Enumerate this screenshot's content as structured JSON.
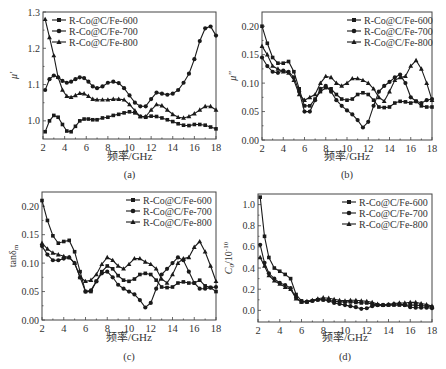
{
  "figure": {
    "legend_labels": [
      "R-Co@C/Fe-600",
      "R-Co@C/Fe-700",
      "R-Co@C/Fe-800"
    ],
    "xlabel": "频率/GHz"
  },
  "chart_data": [
    {
      "id": "a",
      "type": "line",
      "caption": "(a)",
      "title": "",
      "xlabel": "频率/GHz",
      "ylabel": "μ'",
      "xlim": [
        2,
        18
      ],
      "ylim": [
        0.95,
        1.3
      ],
      "xticks": [
        2,
        4,
        6,
        8,
        10,
        12,
        14,
        16,
        18
      ],
      "yticks": [
        1.0,
        1.1,
        1.2,
        1.3
      ],
      "ytick_labels": [
        "1.0",
        "1.1",
        "1.2",
        "1.3"
      ],
      "legend_position": "upper left",
      "grid": false,
      "series": [
        {
          "name": "R-Co@C/Fe-600",
          "marker": "square",
          "x": [
            2.2,
            2.6,
            3.0,
            3.4,
            3.8,
            4.2,
            4.6,
            5.0,
            5.4,
            5.8,
            6.2,
            6.6,
            7.0,
            7.5,
            8.0,
            8.5,
            9.0,
            9.5,
            10.0,
            10.5,
            11.0,
            11.5,
            12.0,
            12.5,
            13.0,
            13.5,
            14.0,
            14.5,
            15.0,
            15.5,
            16.0,
            16.5,
            17.0,
            17.5,
            18.0
          ],
          "y": [
            0.97,
            1.0,
            1.015,
            1.01,
            0.99,
            0.972,
            0.97,
            0.985,
            1.0,
            1.005,
            1.005,
            1.003,
            1.003,
            1.008,
            1.01,
            1.015,
            1.018,
            1.022,
            1.025,
            1.022,
            1.012,
            1.01,
            1.013,
            1.012,
            1.008,
            1.003,
            0.998,
            0.992,
            0.988,
            0.987,
            0.99,
            0.99,
            0.988,
            0.983,
            0.978
          ]
        },
        {
          "name": "R-Co@C/Fe-700",
          "marker": "circle",
          "x": [
            2.2,
            2.6,
            3.0,
            3.4,
            3.8,
            4.2,
            4.6,
            5.0,
            5.4,
            5.8,
            6.2,
            6.6,
            7.0,
            7.5,
            8.0,
            8.5,
            9.0,
            9.5,
            10.0,
            10.5,
            11.0,
            11.5,
            12.0,
            12.5,
            13.0,
            13.5,
            14.0,
            14.5,
            15.0,
            15.5,
            16.0,
            16.5,
            17.0,
            17.5,
            18.0
          ],
          "y": [
            1.085,
            1.115,
            1.125,
            1.12,
            1.11,
            1.105,
            1.108,
            1.115,
            1.12,
            1.118,
            1.108,
            1.095,
            1.09,
            1.095,
            1.105,
            1.108,
            1.104,
            1.09,
            1.07,
            1.05,
            1.04,
            1.04,
            1.06,
            1.078,
            1.075,
            1.072,
            1.075,
            1.085,
            1.105,
            1.13,
            1.17,
            1.22,
            1.255,
            1.26,
            1.235
          ]
        },
        {
          "name": "R-Co@C/Fe-800",
          "marker": "triangle",
          "x": [
            2.2,
            2.6,
            3.0,
            3.4,
            3.8,
            4.2,
            4.6,
            5.0,
            5.4,
            5.8,
            6.2,
            6.6,
            7.0,
            7.5,
            8.0,
            8.5,
            9.0,
            9.5,
            10.0,
            10.5,
            11.0,
            11.5,
            12.0,
            12.5,
            13.0,
            13.5,
            14.0,
            14.5,
            15.0,
            15.5,
            16.0,
            16.5,
            17.0,
            17.5,
            18.0
          ],
          "y": [
            1.28,
            1.23,
            1.18,
            1.12,
            1.085,
            1.068,
            1.065,
            1.07,
            1.076,
            1.075,
            1.068,
            1.06,
            1.058,
            1.058,
            1.058,
            1.06,
            1.06,
            1.058,
            1.045,
            1.028,
            1.012,
            1.012,
            1.03,
            1.045,
            1.042,
            1.03,
            1.018,
            1.01,
            1.008,
            1.012,
            1.02,
            1.03,
            1.04,
            1.04,
            1.03
          ]
        }
      ]
    },
    {
      "id": "b",
      "type": "line",
      "caption": "(b)",
      "title": "",
      "xlabel": "频率/GHz",
      "ylabel": "μ''",
      "xlim": [
        2,
        18
      ],
      "ylim": [
        0.0,
        0.225
      ],
      "xticks": [
        2,
        4,
        6,
        8,
        10,
        12,
        14,
        16,
        18
      ],
      "yticks": [
        0.0,
        0.05,
        0.1,
        0.15,
        0.2
      ],
      "ytick_labels": [
        "0.00",
        "0.05",
        "0.10",
        "0.15",
        "0.20"
      ],
      "legend_position": "upper right",
      "grid": false,
      "series": [
        {
          "name": "R-Co@C/Fe-600",
          "marker": "square",
          "x": [
            2.0,
            2.5,
            3.0,
            3.5,
            4.0,
            4.5,
            5.0,
            5.5,
            6.0,
            6.5,
            7.0,
            7.5,
            8.0,
            8.5,
            9.0,
            9.5,
            10.0,
            10.5,
            11.0,
            11.5,
            12.0,
            12.5,
            13.0,
            13.5,
            14.0,
            14.5,
            15.0,
            15.5,
            16.0,
            16.5,
            17.0,
            17.5,
            18.0
          ],
          "y": [
            0.2,
            0.17,
            0.145,
            0.135,
            0.135,
            0.138,
            0.12,
            0.09,
            0.06,
            0.06,
            0.072,
            0.085,
            0.092,
            0.09,
            0.08,
            0.072,
            0.07,
            0.072,
            0.08,
            0.083,
            0.08,
            0.07,
            0.058,
            0.057,
            0.058,
            0.065,
            0.068,
            0.067,
            0.065,
            0.068,
            0.06,
            0.058,
            0.058
          ]
        },
        {
          "name": "R-Co@C/Fe-700",
          "marker": "circle",
          "x": [
            2.0,
            2.5,
            3.0,
            3.5,
            4.0,
            4.5,
            5.0,
            5.5,
            6.0,
            6.5,
            7.0,
            7.5,
            8.0,
            8.5,
            9.0,
            9.5,
            10.0,
            10.5,
            11.0,
            11.5,
            12.0,
            12.5,
            13.0,
            13.5,
            14.0,
            14.5,
            15.0,
            15.5,
            16.0,
            16.5,
            17.0,
            17.5,
            18.0
          ],
          "y": [
            0.145,
            0.13,
            0.12,
            0.118,
            0.122,
            0.12,
            0.11,
            0.085,
            0.05,
            0.05,
            0.07,
            0.09,
            0.095,
            0.085,
            0.07,
            0.06,
            0.052,
            0.045,
            0.035,
            0.022,
            0.032,
            0.06,
            0.085,
            0.095,
            0.102,
            0.11,
            0.115,
            0.1,
            0.075,
            0.068,
            0.065,
            0.07,
            0.072
          ]
        },
        {
          "name": "R-Co@C/Fe-800",
          "marker": "triangle",
          "x": [
            2.0,
            2.5,
            3.0,
            3.5,
            4.0,
            4.5,
            5.0,
            5.5,
            6.0,
            6.5,
            7.0,
            7.5,
            8.0,
            8.5,
            9.0,
            9.5,
            10.0,
            10.5,
            11.0,
            11.5,
            12.0,
            12.5,
            13.0,
            13.5,
            14.0,
            14.5,
            15.0,
            15.5,
            16.0,
            16.5,
            17.0,
            17.5,
            18.0
          ],
          "y": [
            0.165,
            0.15,
            0.13,
            0.125,
            0.12,
            0.118,
            0.105,
            0.08,
            0.07,
            0.075,
            0.08,
            0.1,
            0.112,
            0.11,
            0.1,
            0.095,
            0.1,
            0.108,
            0.108,
            0.105,
            0.1,
            0.09,
            0.075,
            0.068,
            0.085,
            0.105,
            0.11,
            0.112,
            0.13,
            0.14,
            0.125,
            0.1,
            0.07
          ]
        }
      ]
    },
    {
      "id": "c",
      "type": "line",
      "caption": "(c)",
      "title": "",
      "xlabel": "频率/GHz",
      "ylabel": "tanδm",
      "xlim": [
        2,
        18
      ],
      "ylim": [
        0.0,
        0.225
      ],
      "xticks": [
        2,
        4,
        6,
        8,
        10,
        12,
        14,
        16,
        18
      ],
      "yticks": [
        0.0,
        0.05,
        0.1,
        0.15,
        0.2
      ],
      "ytick_labels": [
        "0.00",
        "0.05",
        "0.10",
        "0.15",
        "0.20"
      ],
      "legend_position": "upper right",
      "grid": false,
      "series": [
        {
          "name": "R-Co@C/Fe-600",
          "marker": "square",
          "x": [
            2.0,
            2.5,
            3.0,
            3.5,
            4.0,
            4.5,
            5.0,
            5.5,
            6.0,
            6.5,
            7.0,
            7.5,
            8.0,
            8.5,
            9.0,
            9.5,
            10.0,
            10.5,
            11.0,
            11.5,
            12.0,
            12.5,
            13.0,
            13.5,
            14.0,
            14.5,
            15.0,
            15.5,
            16.0,
            16.5,
            17.0,
            17.5,
            18.0
          ],
          "y": [
            0.21,
            0.175,
            0.148,
            0.135,
            0.138,
            0.14,
            0.12,
            0.085,
            0.05,
            0.05,
            0.068,
            0.085,
            0.095,
            0.09,
            0.078,
            0.07,
            0.068,
            0.072,
            0.08,
            0.082,
            0.08,
            0.07,
            0.058,
            0.057,
            0.058,
            0.065,
            0.067,
            0.065,
            0.065,
            0.07,
            0.06,
            0.057,
            0.05
          ]
        },
        {
          "name": "R-Co@C/Fe-700",
          "marker": "circle",
          "x": [
            2.0,
            2.5,
            3.0,
            3.5,
            4.0,
            4.5,
            5.0,
            5.5,
            6.0,
            6.5,
            7.0,
            7.5,
            8.0,
            8.5,
            9.0,
            9.5,
            10.0,
            10.5,
            11.0,
            11.5,
            12.0,
            12.5,
            13.0,
            13.5,
            14.0,
            14.5,
            15.0,
            15.5,
            16.0,
            16.5,
            17.0,
            17.5,
            18.0
          ],
          "y": [
            0.13,
            0.115,
            0.105,
            0.105,
            0.108,
            0.11,
            0.1,
            0.075,
            0.05,
            0.052,
            0.068,
            0.082,
            0.085,
            0.075,
            0.062,
            0.055,
            0.05,
            0.045,
            0.035,
            0.022,
            0.03,
            0.055,
            0.08,
            0.09,
            0.1,
            0.11,
            0.105,
            0.085,
            0.065,
            0.055,
            0.055,
            0.057,
            0.058
          ]
        },
        {
          "name": "R-Co@C/Fe-800",
          "marker": "triangle",
          "x": [
            2.0,
            2.5,
            3.0,
            3.5,
            4.0,
            4.5,
            5.0,
            5.5,
            6.0,
            6.5,
            7.0,
            7.5,
            8.0,
            8.5,
            9.0,
            9.5,
            10.0,
            10.5,
            11.0,
            11.5,
            12.0,
            12.5,
            13.0,
            13.5,
            14.0,
            14.5,
            15.0,
            15.5,
            16.0,
            16.5,
            17.0,
            17.5,
            18.0
          ],
          "y": [
            0.135,
            0.125,
            0.118,
            0.115,
            0.112,
            0.11,
            0.1,
            0.075,
            0.068,
            0.07,
            0.08,
            0.098,
            0.11,
            0.105,
            0.095,
            0.09,
            0.098,
            0.108,
            0.108,
            0.102,
            0.098,
            0.09,
            0.072,
            0.065,
            0.08,
            0.1,
            0.108,
            0.11,
            0.128,
            0.138,
            0.12,
            0.095,
            0.068
          ]
        }
      ]
    },
    {
      "id": "d",
      "type": "line",
      "caption": "(d)",
      "title": "",
      "xlabel": "频率/GHz",
      "ylabel": "C0/10^-10",
      "xlim": [
        2,
        18
      ],
      "ylim": [
        -0.11,
        1.1
      ],
      "xticks": [
        2,
        4,
        6,
        8,
        10,
        12,
        14,
        16,
        18
      ],
      "yticks": [
        0.0,
        0.2,
        0.4,
        0.6,
        0.8,
        1.0
      ],
      "ytick_labels": [
        "0.0",
        "0.2",
        "0.4",
        "0.6",
        "0.8",
        "1.0"
      ],
      "legend_position": "upper right",
      "grid": false,
      "series": [
        {
          "name": "R-Co@C/Fe-600",
          "marker": "square",
          "x": [
            2.2,
            2.6,
            3.0,
            3.5,
            4.0,
            4.5,
            5.0,
            5.5,
            6.0,
            6.5,
            7.0,
            7.5,
            8.0,
            8.5,
            9.0,
            9.5,
            10.0,
            10.5,
            11.0,
            11.5,
            12.0,
            12.5,
            13.0,
            13.5,
            14.0,
            14.5,
            15.0,
            15.5,
            16.0,
            16.5,
            17.0,
            17.5,
            18.0
          ],
          "y": [
            1.07,
            0.7,
            0.5,
            0.4,
            0.37,
            0.34,
            0.3,
            0.15,
            0.09,
            0.08,
            0.09,
            0.1,
            0.1,
            0.095,
            0.085,
            0.08,
            0.08,
            0.08,
            0.075,
            0.07,
            0.07,
            0.06,
            0.05,
            0.05,
            0.05,
            0.05,
            0.05,
            0.05,
            0.05,
            0.05,
            0.045,
            0.04,
            0.03
          ]
        },
        {
          "name": "R-Co@C/Fe-700",
          "marker": "circle",
          "x": [
            2.2,
            2.6,
            3.0,
            3.5,
            4.0,
            4.5,
            5.0,
            5.5,
            6.0,
            6.5,
            7.0,
            7.5,
            8.0,
            8.5,
            9.0,
            9.5,
            10.0,
            10.5,
            11.0,
            11.5,
            12.0,
            12.5,
            13.0,
            13.5,
            14.0,
            14.5,
            15.0,
            15.5,
            16.0,
            16.5,
            17.0,
            17.5,
            18.0
          ],
          "y": [
            0.62,
            0.45,
            0.35,
            0.3,
            0.26,
            0.24,
            0.21,
            0.12,
            0.08,
            0.08,
            0.09,
            0.1,
            0.1,
            0.09,
            0.07,
            0.06,
            0.05,
            0.04,
            0.03,
            0.015,
            0.02,
            0.04,
            0.05,
            0.05,
            0.055,
            0.06,
            0.06,
            0.05,
            0.03,
            0.025,
            0.025,
            0.025,
            0.02
          ]
        },
        {
          "name": "R-Co@C/Fe-800",
          "marker": "triangle",
          "x": [
            2.2,
            2.6,
            3.0,
            3.5,
            4.0,
            4.5,
            5.0,
            5.5,
            6.0,
            6.5,
            7.0,
            7.5,
            8.0,
            8.5,
            9.0,
            9.5,
            10.0,
            10.5,
            11.0,
            11.5,
            12.0,
            12.5,
            13.0,
            13.5,
            14.0,
            14.5,
            15.0,
            15.5,
            16.0,
            16.5,
            17.0,
            17.5,
            18.0
          ],
          "y": [
            0.5,
            0.42,
            0.33,
            0.28,
            0.25,
            0.22,
            0.2,
            0.11,
            0.08,
            0.085,
            0.095,
            0.11,
            0.12,
            0.115,
            0.105,
            0.095,
            0.09,
            0.095,
            0.095,
            0.09,
            0.085,
            0.075,
            0.06,
            0.05,
            0.055,
            0.065,
            0.07,
            0.07,
            0.075,
            0.075,
            0.065,
            0.055,
            0.04
          ]
        }
      ]
    }
  ],
  "layout": {
    "panels": [
      {
        "x0": 43,
        "x1": 216,
        "ytop": 12,
        "ybot": 139,
        "legend": {
          "x": 52,
          "y": 20
        },
        "caption_y": 178,
        "xlabel_y": 160
      },
      {
        "x0": 262,
        "x1": 432,
        "ytop": 12,
        "ybot": 140,
        "legend": {
          "x": 347,
          "y": 20
        },
        "caption_y": 178,
        "xlabel_y": 160
      },
      {
        "x0": 42,
        "x1": 216,
        "ytop": 192,
        "ybot": 320,
        "legend": {
          "x": 126,
          "y": 200
        },
        "caption_y": 360,
        "xlabel_y": 341
      },
      {
        "x0": 258,
        "x1": 432,
        "ytop": 194,
        "ybot": 322,
        "legend": {
          "x": 342,
          "y": 202
        },
        "caption_y": 360,
        "xlabel_y": 341
      }
    ]
  }
}
